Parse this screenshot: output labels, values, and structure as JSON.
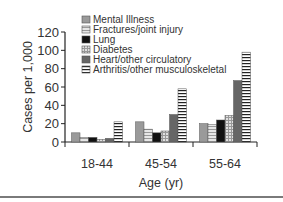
{
  "chart_data": {
    "type": "bar",
    "title": "",
    "xlabel": "Age (yr)",
    "ylabel": "Cases per 1,000",
    "ylim": [
      0,
      120
    ],
    "yticks": [
      0,
      20,
      40,
      60,
      80,
      100,
      120
    ],
    "categories": [
      "18-44",
      "45-54",
      "55-64"
    ],
    "grid": false,
    "legend_position": "top-inside",
    "series": [
      {
        "name": "Mental Illness",
        "values": [
          10,
          22,
          20
        ],
        "fill": "#9a9a9a",
        "pattern": "solid"
      },
      {
        "name": "Fractures/joint injury",
        "values": [
          5,
          14,
          19
        ],
        "fill": "#d9d9d9",
        "pattern": "hlines-light"
      },
      {
        "name": "Lung",
        "values": [
          5,
          10,
          24
        ],
        "fill": "#111111",
        "pattern": "solid"
      },
      {
        "name": "Diabetes",
        "values": [
          3,
          12,
          29
        ],
        "fill": "#cfcfcf",
        "pattern": "grid"
      },
      {
        "name": "Heart/other circulatory",
        "values": [
          4,
          30,
          67
        ],
        "fill": "#666666",
        "pattern": "solid"
      },
      {
        "name": "Arthritis/other musculoskeletal",
        "values": [
          22,
          58,
          98
        ],
        "fill": "#ffffff",
        "pattern": "hlines"
      }
    ]
  }
}
